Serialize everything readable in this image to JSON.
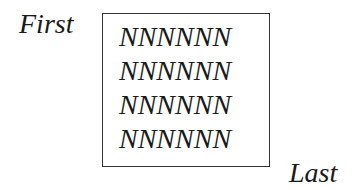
{
  "labels": {
    "first": "First",
    "last": "Last"
  },
  "box": {
    "lines": [
      "NNNNNN",
      "NNNNNN",
      "NNNNNN",
      "NNNNNN"
    ]
  }
}
